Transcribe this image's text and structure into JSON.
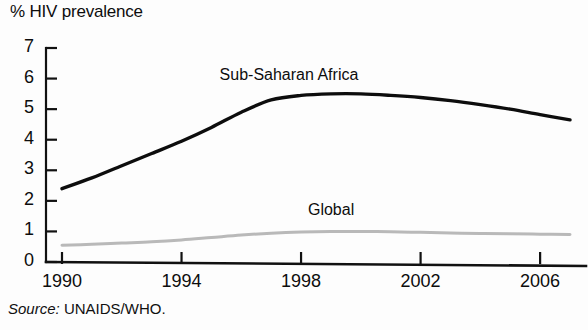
{
  "chart_data": {
    "type": "line",
    "title": "% HIV prevalence",
    "xlabel": "",
    "ylabel": "% HIV prevalence",
    "xlim": [
      1990,
      2007
    ],
    "ylim": [
      0,
      7
    ],
    "grid": false,
    "legend_position": "inline-annotation",
    "xticks": [
      "1990",
      "1994",
      "1998",
      "2002",
      "2006"
    ],
    "xtick_values": [
      1990,
      1994,
      1998,
      2002,
      2006
    ],
    "yticks": [
      "0",
      "1",
      "2",
      "3",
      "4",
      "5",
      "6",
      "7"
    ],
    "ytick_values": [
      0,
      1,
      2,
      3,
      4,
      5,
      6,
      7
    ],
    "x": [
      1990,
      1991,
      1992,
      1993,
      1994,
      1995,
      1996,
      1997,
      1998,
      1999,
      2000,
      2001,
      2002,
      2003,
      2004,
      2005,
      2006,
      2007
    ],
    "series": [
      {
        "name": "Sub-Saharan Africa",
        "color": "#0d0d0d",
        "width": 3.4,
        "values": [
          2.4,
          2.75,
          3.15,
          3.55,
          3.95,
          4.4,
          4.9,
          5.3,
          5.45,
          5.5,
          5.5,
          5.45,
          5.38,
          5.28,
          5.15,
          5.0,
          4.82,
          4.65
        ],
        "label_x": 1997.6,
        "label_y": 6.05
      },
      {
        "name": "Global",
        "color": "#b9b9b9",
        "width": 3.0,
        "values": [
          0.55,
          0.58,
          0.62,
          0.66,
          0.72,
          0.8,
          0.88,
          0.94,
          0.98,
          1.0,
          1.0,
          0.99,
          0.97,
          0.95,
          0.93,
          0.92,
          0.91,
          0.9
        ],
        "label_x": 1999.0,
        "label_y": 1.62
      }
    ],
    "axis_color": "#111111",
    "source": {
      "prefix": "Source:",
      "text": "UNAIDS/WHO."
    }
  }
}
